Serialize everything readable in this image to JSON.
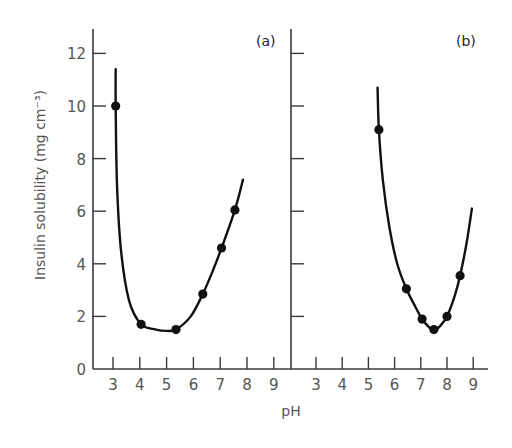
{
  "chart_data": {
    "type": "scatter",
    "title": "",
    "xlabel": "pH",
    "ylabel": "Insulin solubility (mg cm⁻³)",
    "ylim": [
      0,
      12
    ],
    "xlim": [
      3,
      9
    ],
    "y_ticks": [
      0,
      2,
      4,
      6,
      8,
      10,
      12
    ],
    "x_ticks": [
      3,
      4,
      5,
      6,
      7,
      8,
      9
    ],
    "grid": false,
    "legend": null,
    "panels": [
      {
        "label": "(a)",
        "points": [
          {
            "x": 3.1,
            "y": 10.0
          },
          {
            "x": 4.05,
            "y": 1.7
          },
          {
            "x": 5.35,
            "y": 1.5
          },
          {
            "x": 6.35,
            "y": 2.85
          },
          {
            "x": 7.05,
            "y": 4.6
          },
          {
            "x": 7.55,
            "y": 6.05
          }
        ],
        "curve": [
          {
            "x": 3.1,
            "y": 11.4
          },
          {
            "x": 3.1,
            "y": 10.0
          },
          {
            "x": 3.15,
            "y": 7.0
          },
          {
            "x": 3.3,
            "y": 4.5
          },
          {
            "x": 3.6,
            "y": 2.6
          },
          {
            "x": 4.05,
            "y": 1.7
          },
          {
            "x": 4.6,
            "y": 1.5
          },
          {
            "x": 5.0,
            "y": 1.45
          },
          {
            "x": 5.35,
            "y": 1.5
          },
          {
            "x": 5.9,
            "y": 2.0
          },
          {
            "x": 6.35,
            "y": 2.85
          },
          {
            "x": 6.75,
            "y": 3.8
          },
          {
            "x": 7.05,
            "y": 4.6
          },
          {
            "x": 7.55,
            "y": 6.05
          },
          {
            "x": 7.85,
            "y": 7.2
          }
        ]
      },
      {
        "label": "(b)",
        "points": [
          {
            "x": 5.4,
            "y": 9.1
          },
          {
            "x": 6.45,
            "y": 3.05
          },
          {
            "x": 7.05,
            "y": 1.9
          },
          {
            "x": 7.5,
            "y": 1.5
          },
          {
            "x": 8.0,
            "y": 2.0
          },
          {
            "x": 8.5,
            "y": 3.55
          }
        ],
        "curve": [
          {
            "x": 5.35,
            "y": 10.7
          },
          {
            "x": 5.4,
            "y": 9.1
          },
          {
            "x": 5.55,
            "y": 7.2
          },
          {
            "x": 5.8,
            "y": 5.4
          },
          {
            "x": 6.1,
            "y": 4.0
          },
          {
            "x": 6.45,
            "y": 3.05
          },
          {
            "x": 6.8,
            "y": 2.35
          },
          {
            "x": 7.05,
            "y": 1.9
          },
          {
            "x": 7.3,
            "y": 1.6
          },
          {
            "x": 7.5,
            "y": 1.45
          },
          {
            "x": 7.75,
            "y": 1.65
          },
          {
            "x": 8.0,
            "y": 2.0
          },
          {
            "x": 8.3,
            "y": 2.8
          },
          {
            "x": 8.5,
            "y": 3.55
          },
          {
            "x": 8.75,
            "y": 4.8
          },
          {
            "x": 8.95,
            "y": 6.1
          }
        ]
      }
    ]
  }
}
